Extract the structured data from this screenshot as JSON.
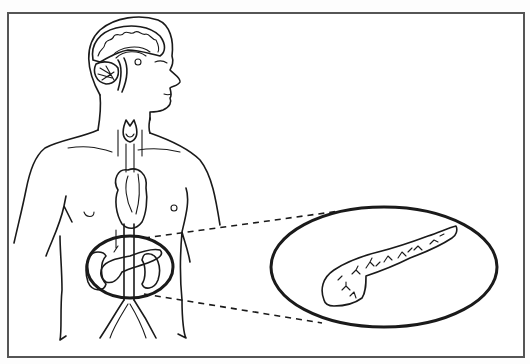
{
  "figure": {
    "title": "Location of the pancreas in the human body",
    "subject": "pancreas",
    "elements": {
      "frame": "figure-border",
      "body": "human-torso-outline",
      "head": "head-with-brain-cross-section",
      "thyroid": "thyroid-gland",
      "heart": "heart",
      "aorta": "aorta-and-iliac-arteries",
      "kidneys": "kidneys",
      "highlight": "pancreas-highlight-ellipse",
      "callout": "magnified-pancreas-callout",
      "connectors": "dashed-zoom-connector-lines"
    }
  },
  "colors": {
    "ink": "#1a1a1a",
    "frame": "#555555",
    "background": "#ffffff"
  }
}
